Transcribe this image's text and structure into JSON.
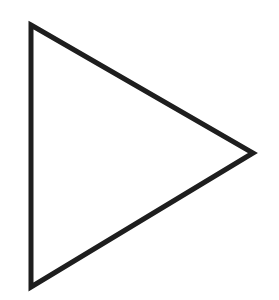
{
  "shape": {
    "type": "triangle",
    "orientation": "pointing-right",
    "vertices": [
      [
        31,
        25
      ],
      [
        253,
        153
      ],
      [
        31,
        287
      ]
    ],
    "stroke_color": "#1e1e1e",
    "stroke_width": 5,
    "fill": "none"
  },
  "background": "#ffffff"
}
